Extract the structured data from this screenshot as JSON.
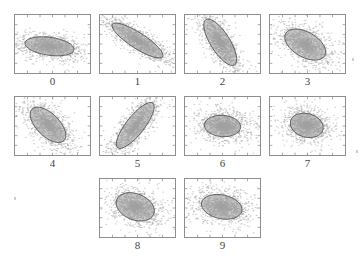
{
  "figure": {
    "title": "",
    "background_color": "#ffffff",
    "panel_border_color": "#8e8e8e",
    "point_color": "#a8a8a8",
    "ellipse_fill_color": "#9d9d9d",
    "ellipse_stroke_color": "#5a5a5a",
    "label_color": "#444444",
    "rows": 3,
    "columns": 4,
    "panel_count": 10
  },
  "chart_data": {
    "type": "scatter",
    "title": "",
    "xlabel": "",
    "ylabel": "",
    "xlim": [
      0,
      1
    ],
    "ylim": [
      0,
      1
    ],
    "grid": false,
    "legend": "none",
    "tick_count_x": 6,
    "tick_count_y": 6,
    "panels": [
      {
        "label": "0",
        "row": 0,
        "col": 0,
        "center": [
          0.46,
          0.46
        ],
        "rx": 0.33,
        "ry": 0.155,
        "angle_deg": -8,
        "n_points": 1400,
        "spread": 0.09
      },
      {
        "label": "1",
        "row": 0,
        "col": 1,
        "center": [
          0.5,
          0.56
        ],
        "rx": 0.4,
        "ry": 0.135,
        "angle_deg": -33,
        "n_points": 1400,
        "spread": 0.1
      },
      {
        "label": "2",
        "row": 0,
        "col": 2,
        "center": [
          0.47,
          0.53
        ],
        "rx": 0.36,
        "ry": 0.165,
        "angle_deg": -58,
        "n_points": 1400,
        "spread": 0.1
      },
      {
        "label": "3",
        "row": 0,
        "col": 3,
        "center": [
          0.47,
          0.49
        ],
        "rx": 0.3,
        "ry": 0.215,
        "angle_deg": -30,
        "n_points": 1400,
        "spread": 0.1
      },
      {
        "label": "4",
        "row": 1,
        "col": 0,
        "center": [
          0.44,
          0.52
        ],
        "rx": 0.3,
        "ry": 0.195,
        "angle_deg": -45,
        "n_points": 1400,
        "spread": 0.1
      },
      {
        "label": "5",
        "row": 1,
        "col": 1,
        "center": [
          0.47,
          0.51
        ],
        "rx": 0.38,
        "ry": 0.155,
        "angle_deg": 52,
        "n_points": 1400,
        "spread": 0.1
      },
      {
        "label": "6",
        "row": 1,
        "col": 2,
        "center": [
          0.5,
          0.5
        ],
        "rx": 0.245,
        "ry": 0.185,
        "angle_deg": -4,
        "n_points": 1400,
        "spread": 0.11
      },
      {
        "label": "7",
        "row": 1,
        "col": 3,
        "center": [
          0.49,
          0.51
        ],
        "rx": 0.225,
        "ry": 0.205,
        "angle_deg": -15,
        "n_points": 1400,
        "spread": 0.11
      },
      {
        "label": "8",
        "row": 2,
        "col": 1,
        "center": [
          0.47,
          0.52
        ],
        "rx": 0.265,
        "ry": 0.225,
        "angle_deg": -22,
        "n_points": 1400,
        "spread": 0.11
      },
      {
        "label": "9",
        "row": 2,
        "col": 2,
        "center": [
          0.49,
          0.52
        ],
        "rx": 0.275,
        "ry": 0.205,
        "angle_deg": -12,
        "n_points": 1400,
        "spread": 0.11
      }
    ]
  },
  "artifacts": {
    "speck_label": "scan-speck"
  }
}
